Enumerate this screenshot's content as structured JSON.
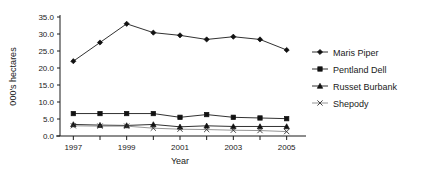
{
  "chart_data": {
    "type": "line",
    "title": "",
    "xlabel": "Year",
    "ylabel": "000's hectares",
    "x": [
      1997,
      1998,
      1999,
      2000,
      2001,
      2002,
      2003,
      2004,
      2005
    ],
    "xtick_labels": [
      "1997",
      "1999",
      "2001",
      "2003",
      "2005"
    ],
    "xtick_values": [
      1997,
      1999,
      2001,
      2003,
      2005
    ],
    "ytick_labels": [
      "0.0",
      "5.0",
      "10.0",
      "15.0",
      "20.0",
      "25.0",
      "30.0",
      "35.0"
    ],
    "ytick_values": [
      0.0,
      5.0,
      10.0,
      15.0,
      20.0,
      25.0,
      30.0,
      35.0
    ],
    "xlim": [
      1996.5,
      2005.5
    ],
    "ylim": [
      0.0,
      35.0
    ],
    "grid": false,
    "legend_position": "right",
    "series": [
      {
        "name": "Maris Piper",
        "marker": "diamond",
        "color": "#1a1a1a",
        "values": [
          22.0,
          27.5,
          33.0,
          30.4,
          29.6,
          28.4,
          29.2,
          28.4,
          25.3
        ]
      },
      {
        "name": "Pentland Dell",
        "marker": "square",
        "color": "#1a1a1a",
        "values": [
          6.6,
          6.6,
          6.6,
          6.6,
          5.5,
          6.3,
          5.5,
          5.3,
          5.1
        ]
      },
      {
        "name": "Russet Burbank",
        "marker": "triangle",
        "color": "#1a1a1a",
        "values": [
          3.4,
          3.2,
          3.1,
          3.4,
          2.7,
          3.0,
          2.8,
          2.8,
          2.8
        ]
      },
      {
        "name": "Shepody",
        "marker": "x",
        "color": "#8a8a8a",
        "values": [
          3.0,
          2.9,
          2.9,
          2.3,
          2.0,
          1.9,
          1.7,
          1.6,
          1.3
        ]
      }
    ]
  }
}
